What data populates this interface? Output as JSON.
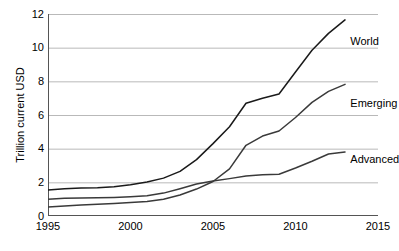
{
  "chart_data": {
    "type": "line",
    "title": "",
    "xlabel": "",
    "ylabel": "Trillion current USD",
    "xlim": [
      1995,
      2015
    ],
    "ylim": [
      0,
      12
    ],
    "xticks": [
      1995,
      2000,
      2005,
      2010,
      2015
    ],
    "yticks": [
      0,
      2,
      4,
      6,
      8,
      10,
      12
    ],
    "grid": "horizontal",
    "legend_position": "line-end-labels",
    "x": [
      1995,
      1996,
      1997,
      1998,
      1999,
      2000,
      2001,
      2002,
      2003,
      2004,
      2005,
      2006,
      2007,
      2008,
      2009,
      2010,
      2011,
      2012,
      2013
    ],
    "series": [
      {
        "name": "World",
        "color": "#1a1a1a",
        "values": [
          1.55,
          1.62,
          1.66,
          1.68,
          1.74,
          1.86,
          2.02,
          2.25,
          2.65,
          3.35,
          4.3,
          5.3,
          6.7,
          7.0,
          7.25,
          8.55,
          9.85,
          10.85,
          11.65
        ],
        "label_x": 2013.2,
        "label_y": 10.35
      },
      {
        "name": "Emerging",
        "color": "#3a3a3a",
        "values": [
          0.53,
          0.6,
          0.66,
          0.7,
          0.75,
          0.8,
          0.86,
          1.0,
          1.25,
          1.6,
          2.05,
          2.8,
          4.2,
          4.75,
          5.05,
          5.85,
          6.75,
          7.4,
          7.82
        ],
        "label_x": 2013.2,
        "label_y": 6.7
      },
      {
        "name": "Advanced",
        "color": "#3a3a3a",
        "values": [
          1.0,
          1.05,
          1.07,
          1.08,
          1.1,
          1.14,
          1.2,
          1.36,
          1.62,
          1.9,
          2.08,
          2.22,
          2.38,
          2.45,
          2.48,
          2.85,
          3.25,
          3.68,
          3.8
        ],
        "label_x": 2013.2,
        "label_y": 3.35
      }
    ],
    "caption_partial": ""
  }
}
